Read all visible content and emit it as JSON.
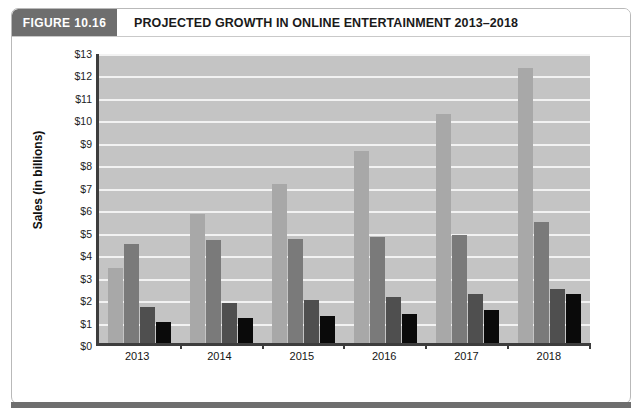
{
  "figure": {
    "number_label": "FIGURE 10.16",
    "title": "PROJECTED GROWTH IN ONLINE ENTERTAINMENT 2013–2018",
    "caption": ""
  },
  "colors": {
    "figure_number_bg": "#6e6e6e",
    "plot_bg": "#c4c4c4",
    "gridline": "#f2f2f2",
    "axis": "#3d3d3d",
    "series_online_tv_and_movies": "#a8a8a8",
    "series_online_music": "#7a7a7a",
    "series_games": "#4f4f4f",
    "series_internet_radio": "#0a0a0a"
  },
  "chart_data": {
    "type": "bar",
    "title": "PROJECTED GROWTH IN ONLINE ENTERTAINMENT 2013–2018",
    "xlabel": "",
    "ylabel": "Sales (in billions)",
    "ylim": [
      0,
      13
    ],
    "ytick_step": 1,
    "ytick_labels": [
      "$0",
      "$1",
      "$2",
      "$3",
      "$4",
      "$5",
      "$6",
      "$7",
      "$8",
      "$9",
      "$10",
      "$11",
      "$12",
      "$13"
    ],
    "ytick_values": [
      0,
      1,
      2,
      3,
      4,
      5,
      6,
      7,
      8,
      9,
      10,
      11,
      12,
      13
    ],
    "grid": true,
    "legend_position": "bottom",
    "categories": [
      "2013",
      "2014",
      "2015",
      "2016",
      "2017",
      "2018"
    ],
    "series": [
      {
        "name": "Online TV and movies",
        "color": "#a8a8a8",
        "values": [
          3.35,
          5.75,
          7.1,
          8.55,
          10.2,
          12.25
        ]
      },
      {
        "name": "Online music",
        "color": "#7a7a7a",
        "values": [
          4.4,
          4.6,
          4.65,
          4.7,
          4.8,
          5.4
        ]
      },
      {
        "name": "Games",
        "color": "#4f4f4f",
        "values": [
          1.6,
          1.8,
          1.9,
          2.05,
          2.2,
          2.4
        ]
      },
      {
        "name": "Internet radio",
        "color": "#0a0a0a",
        "values": [
          0.95,
          1.1,
          1.2,
          1.3,
          1.45,
          2.2
        ]
      }
    ]
  }
}
